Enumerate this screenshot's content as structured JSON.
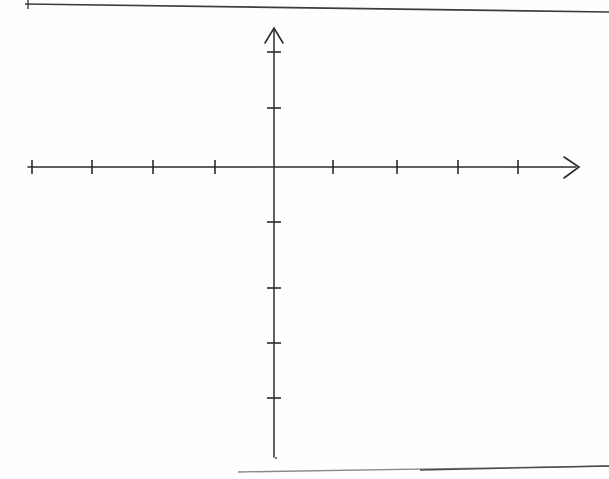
{
  "document": {
    "kind": "scanned-worksheet-page",
    "background_color": "#fefefe",
    "page_width": 609,
    "page_height": 479,
    "ink_color": "#2b2b2b",
    "scan_edge_color": "#4a4a4a",
    "title": "Blank Cartesian Coordinate Axes"
  },
  "scan_artifacts": {
    "top_rule": {
      "name": "top-scan-edge",
      "x1": 25,
      "y1": 4,
      "x2": 609,
      "y2": 12,
      "stroke_width": 1.6,
      "color": "#3d3d3d"
    },
    "top_stub": {
      "name": "top-left-corner-stub",
      "x1": 28,
      "y1": 0,
      "x2": 28,
      "y2": 9,
      "stroke_width": 1.4,
      "color": "#3d3d3d"
    },
    "bottom_rule": {
      "name": "bottom-scan-edge",
      "x1": 238,
      "y1": 472,
      "x2": 609,
      "y2": 466,
      "stroke_width": 1.4,
      "color": "#7a7a7a"
    },
    "speck": {
      "name": "scan-speck",
      "cx": 276,
      "cy": 458,
      "r": 1.1,
      "color": "#555555"
    }
  },
  "chart_data": {
    "type": "scatter",
    "title": "",
    "subtitle": "",
    "xlabel": "",
    "ylabel": "",
    "legend": [],
    "annotations": [],
    "grid": false,
    "series": [],
    "values": [],
    "x": [],
    "origin": {
      "px": 274,
      "py": 167
    },
    "tick_spacing_px": {
      "x": 61,
      "y": 56
    },
    "xlim": [
      -4,
      4
    ],
    "ylim": [
      -5,
      2
    ],
    "x_tick_labels": [],
    "y_tick_labels": [],
    "axes": {
      "x_axis": {
        "name": "x-axis",
        "x1": 28,
        "y1": 167,
        "x2": 578,
        "y2": 167,
        "stroke_width": 1.5,
        "arrow_end": "right",
        "arrow_start": "none"
      },
      "y_axis": {
        "name": "y-axis",
        "x1": 274,
        "y1": 28,
        "x2": 274,
        "y2": 457,
        "stroke_width": 1.5,
        "arrow_end": "top",
        "arrow_start": "none"
      }
    },
    "x_ticks": [
      {
        "label": "",
        "px": 32,
        "value": -4
      },
      {
        "label": "",
        "px": 92,
        "value": -3
      },
      {
        "label": "",
        "px": 153,
        "value": -2
      },
      {
        "label": "",
        "px": 215,
        "value": -1
      },
      {
        "label": "",
        "px": 333,
        "value": 1
      },
      {
        "label": "",
        "px": 397,
        "value": 2
      },
      {
        "label": "",
        "px": 458,
        "value": 3
      },
      {
        "label": "",
        "px": 518,
        "value": 4
      }
    ],
    "y_ticks": [
      {
        "label": "",
        "py": 52,
        "value": 2
      },
      {
        "label": "",
        "py": 108,
        "value": 1
      },
      {
        "label": "",
        "py": 222,
        "value": -1
      },
      {
        "label": "",
        "py": 288,
        "value": -2
      },
      {
        "label": "",
        "py": 343,
        "value": -3
      },
      {
        "label": "",
        "py": 398,
        "value": -4
      }
    ],
    "tick_half_length": {
      "x": 7,
      "y": 7
    },
    "arrowheads": {
      "x_arrow": {
        "name": "x-axis-arrowhead",
        "tip_x": 578,
        "tip_y": 167,
        "size": 13
      },
      "y_arrow": {
        "name": "y-axis-arrowhead",
        "tip_x": 274,
        "tip_y": 28,
        "size": 13
      }
    }
  }
}
